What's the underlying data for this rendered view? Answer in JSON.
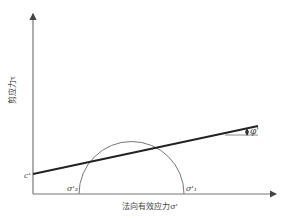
{
  "diagram": {
    "axes": {
      "x_label": "法向有效应力σ'",
      "y_label": "剪应力τ"
    },
    "labels": {
      "cohesion": "c'",
      "sigma3": "σ'₃",
      "sigma1": "σ'₁",
      "friction_angle": "φ'"
    },
    "colors": {
      "axis": "#555555",
      "envelope": "#222222",
      "circle": "#666666",
      "text": "#444444"
    }
  }
}
